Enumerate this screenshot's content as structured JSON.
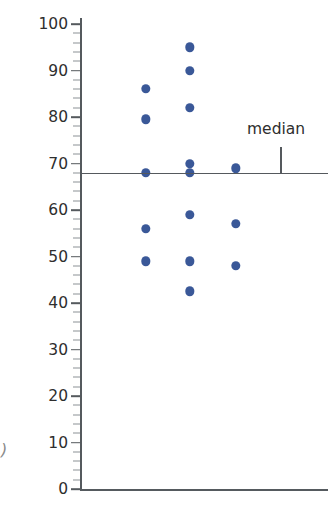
{
  "chart_data": {
    "type": "scatter",
    "title": "",
    "xlabel": "",
    "ylabel": "Environmental quality scores",
    "ylim": [
      0,
      100
    ],
    "ytick_labels": [
      "0",
      "10",
      "20",
      "30",
      "40",
      "50",
      "60",
      "70",
      "80",
      "90",
      "100"
    ],
    "yticks": [
      0,
      10,
      20,
      30,
      40,
      50,
      60,
      70,
      80,
      90,
      100
    ],
    "y_minor_tick_step": 2,
    "grid": false,
    "legend": null,
    "point_color": "#3a5898",
    "axis_color": "#55595d",
    "series": [
      {
        "name": "Group 1",
        "x_jitter": 146,
        "values": [
          86,
          79.5,
          68,
          56,
          49
        ]
      },
      {
        "name": "Group 2",
        "x_jitter": 190,
        "values": [
          95,
          90,
          82,
          70,
          68,
          59,
          49,
          42.5
        ]
      },
      {
        "name": "Group 3",
        "x_jitter": 236,
        "values": [
          69,
          57,
          48
        ]
      }
    ],
    "points": [
      {
        "x": 146,
        "y": 86
      },
      {
        "x": 146,
        "y": 79.5
      },
      {
        "x": 146,
        "y": 68
      },
      {
        "x": 146,
        "y": 56
      },
      {
        "x": 146,
        "y": 49
      },
      {
        "x": 190,
        "y": 95
      },
      {
        "x": 190,
        "y": 90
      },
      {
        "x": 190,
        "y": 82
      },
      {
        "x": 190,
        "y": 70
      },
      {
        "x": 190,
        "y": 68
      },
      {
        "x": 190,
        "y": 59
      },
      {
        "x": 190,
        "y": 49
      },
      {
        "x": 190,
        "y": 42.5
      },
      {
        "x": 236,
        "y": 69
      },
      {
        "x": 236,
        "y": 57
      },
      {
        "x": 236,
        "y": 48
      }
    ],
    "annotations": [
      {
        "label": "median",
        "value": 68,
        "type": "horizontal-line-with-callout",
        "pointer_x": 280
      }
    ]
  },
  "axis": {
    "y_title": "Environmental quality scores"
  },
  "marks": {
    "stray_glyph": ")"
  }
}
